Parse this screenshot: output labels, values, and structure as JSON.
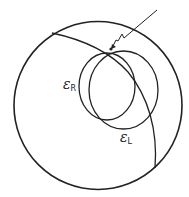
{
  "diagram": {
    "stroke_color": "#222222",
    "labels": {
      "eps_r": {
        "symbol": "ε",
        "subscript": "R"
      },
      "eps_l": {
        "symbol": "ε",
        "subscript": "L"
      }
    }
  }
}
